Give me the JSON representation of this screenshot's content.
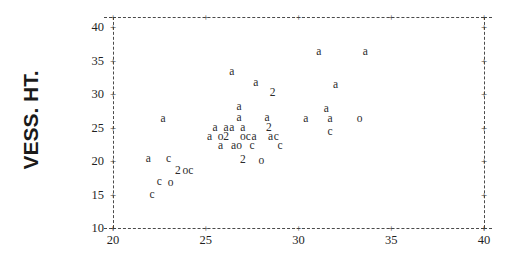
{
  "chart_data": {
    "type": "scatter",
    "title": "",
    "xlabel": "",
    "ylabel": "VESS. HT.",
    "xlim": [
      20,
      40
    ],
    "ylim": [
      10,
      41.5
    ],
    "grid": false,
    "legend": "none",
    "x_ticks": [
      "20",
      "25",
      "30",
      "35",
      "40"
    ],
    "x_tick_values": [
      20,
      25,
      30,
      35,
      40
    ],
    "y_ticks": [
      "10",
      "15",
      "20",
      "25",
      "30",
      "35",
      "40"
    ],
    "y_tick_values": [
      10,
      15,
      20,
      25,
      30,
      35,
      40
    ],
    "tick_marker": "+",
    "frame_style": "dashed",
    "point_label_meaning": "letter code = group (a, c, o); digit = number of overlapping points",
    "points": [
      {
        "label": "a",
        "x": 31.1,
        "y": 36.3
      },
      {
        "label": "a",
        "x": 33.6,
        "y": 36.3
      },
      {
        "label": "a",
        "x": 26.4,
        "y": 33.3
      },
      {
        "label": "a",
        "x": 27.7,
        "y": 31.6
      },
      {
        "label": "a",
        "x": 32.0,
        "y": 31.4
      },
      {
        "label": "2",
        "x": 28.6,
        "y": 30.1
      },
      {
        "label": "a",
        "x": 26.8,
        "y": 28.1
      },
      {
        "label": "a",
        "x": 31.5,
        "y": 27.8
      },
      {
        "label": "a",
        "x": 22.7,
        "y": 26.3
      },
      {
        "label": "a",
        "x": 26.8,
        "y": 26.4
      },
      {
        "label": "a",
        "x": 28.3,
        "y": 26.4
      },
      {
        "label": "a",
        "x": 30.4,
        "y": 26.2
      },
      {
        "label": "a",
        "x": 31.7,
        "y": 26.2
      },
      {
        "label": "o",
        "x": 33.3,
        "y": 26.2
      },
      {
        "label": "a",
        "x": 25.5,
        "y": 25.0
      },
      {
        "label": "a",
        "x": 26.1,
        "y": 25.0
      },
      {
        "label": "a",
        "x": 26.4,
        "y": 25.0
      },
      {
        "label": "a",
        "x": 27.0,
        "y": 25.0
      },
      {
        "label": "2",
        "x": 28.4,
        "y": 25.0
      },
      {
        "label": "c",
        "x": 31.7,
        "y": 24.4
      },
      {
        "label": "a",
        "x": 25.2,
        "y": 23.6
      },
      {
        "label": "o",
        "x": 25.8,
        "y": 23.6
      },
      {
        "label": "2",
        "x": 26.1,
        "y": 23.6
      },
      {
        "label": "o",
        "x": 27.0,
        "y": 23.6
      },
      {
        "label": "c",
        "x": 27.3,
        "y": 23.6
      },
      {
        "label": "a",
        "x": 27.6,
        "y": 23.6
      },
      {
        "label": "a",
        "x": 28.5,
        "y": 23.6
      },
      {
        "label": "c",
        "x": 28.8,
        "y": 23.6
      },
      {
        "label": "a",
        "x": 25.8,
        "y": 22.3
      },
      {
        "label": "a",
        "x": 26.5,
        "y": 22.3
      },
      {
        "label": "o",
        "x": 26.8,
        "y": 22.3
      },
      {
        "label": "c",
        "x": 27.5,
        "y": 22.3
      },
      {
        "label": "c",
        "x": 29.0,
        "y": 22.3
      },
      {
        "label": "a",
        "x": 21.9,
        "y": 20.3
      },
      {
        "label": "c",
        "x": 23.0,
        "y": 20.3
      },
      {
        "label": "2",
        "x": 27.0,
        "y": 20.2
      },
      {
        "label": "o",
        "x": 28.0,
        "y": 20.0
      },
      {
        "label": "2",
        "x": 23.5,
        "y": 18.5
      },
      {
        "label": "o",
        "x": 23.9,
        "y": 18.5
      },
      {
        "label": "c",
        "x": 24.2,
        "y": 18.5
      },
      {
        "label": "c",
        "x": 22.5,
        "y": 16.8
      },
      {
        "label": "o",
        "x": 23.1,
        "y": 16.7
      },
      {
        "label": "c",
        "x": 22.1,
        "y": 14.9
      }
    ]
  }
}
